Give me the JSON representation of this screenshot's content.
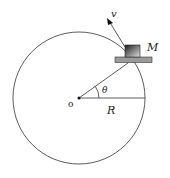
{
  "diagram": {
    "labels": {
      "velocity": "v",
      "mass": "M",
      "angle": "θ",
      "radius": "R",
      "origin": "o"
    },
    "colors": {
      "stroke": "#333333",
      "platform": "#9a9a9a",
      "block_dark": "#222222",
      "block_light": "#dddddd"
    }
  }
}
